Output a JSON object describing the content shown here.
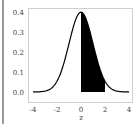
{
  "chart_data": {
    "type": "area",
    "title": "",
    "xlabel": "z",
    "ylabel": "",
    "xlim": [
      -4.4,
      4.3
    ],
    "ylim": [
      -0.018,
      0.42
    ],
    "x_ticks": [
      -4,
      -2,
      0,
      2,
      4
    ],
    "x_tick_labels": [
      "-4",
      "-2",
      "0",
      "2",
      "4"
    ],
    "y_ticks": [
      0.0,
      0.1,
      0.2,
      0.3,
      0.4
    ],
    "y_tick_labels": [
      "0.0",
      "0.1",
      "0.2",
      "0.3",
      "0.4"
    ],
    "grid": false,
    "legend": null,
    "series": [
      {
        "name": "standard normal density",
        "kind": "line",
        "color": "#000000",
        "x": [
          -4,
          -3.5,
          -3,
          -2.5,
          -2,
          -1.5,
          -1,
          -0.5,
          0,
          0.5,
          1,
          1.5,
          2,
          2.5,
          3,
          3.5,
          4
        ],
        "y": [
          0.0001,
          0.0009,
          0.0044,
          0.0175,
          0.054,
          0.1295,
          0.242,
          0.3521,
          0.3989,
          0.3521,
          0.242,
          0.1295,
          0.054,
          0.0175,
          0.0044,
          0.0009,
          0.0001
        ]
      }
    ],
    "shaded_region": {
      "from": 0,
      "to": 2,
      "color": "#000000"
    }
  },
  "axis": {
    "xlabel": "z",
    "x_ticks": [
      "-4",
      "-2",
      "0",
      "2",
      "4"
    ],
    "y_ticks": [
      "0.0",
      "0.1",
      "0.2",
      "0.3",
      "0.4"
    ]
  }
}
